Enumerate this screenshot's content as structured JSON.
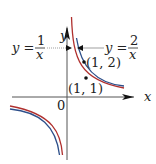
{
  "diagram": {
    "axes": {
      "x_label": "x",
      "y_label": "y",
      "origin_label": "0"
    },
    "curves": [
      {
        "name": "y = 1/x",
        "lhs": "y =",
        "numerator": "1",
        "denominator": "x",
        "color": "#b0302e"
      },
      {
        "name": "y = 2/x",
        "lhs": "y =",
        "numerator": "2",
        "denominator": "x",
        "color": "#2d4f8a"
      }
    ],
    "points": [
      {
        "label": "(1, 2)"
      },
      {
        "label": "(1, 1)"
      }
    ]
  }
}
